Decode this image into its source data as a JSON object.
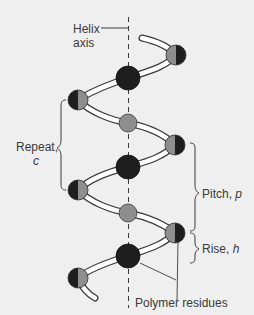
{
  "diagram": {
    "labels": {
      "helix_axis_line1": "Helix",
      "helix_axis_line2": "axis",
      "repeat_line1": "Repeat,",
      "repeat_symbol": "c",
      "pitch_text": "Pitch, ",
      "pitch_symbol": "p",
      "rise_text": "Rise, ",
      "rise_symbol": "h",
      "residues": "Polymer residues"
    },
    "colors": {
      "background": "#efefef",
      "residue_dark": "#1e1e1e",
      "residue_grey": "#8e8e8e",
      "backbone_fill": "#ffffff",
      "outline": "#3a3a3a",
      "text": "#3a3a3a"
    },
    "residues": [
      {
        "id": 1,
        "type": "half-grey-left",
        "position": "right"
      },
      {
        "id": 2,
        "type": "dark",
        "position": "center"
      },
      {
        "id": 3,
        "type": "half-dark-left",
        "position": "left"
      },
      {
        "id": 4,
        "type": "grey",
        "position": "center"
      },
      {
        "id": 5,
        "type": "half-grey-left",
        "position": "right"
      },
      {
        "id": 6,
        "type": "dark",
        "position": "center"
      },
      {
        "id": 7,
        "type": "half-dark-left",
        "position": "left"
      },
      {
        "id": 8,
        "type": "grey",
        "position": "center"
      },
      {
        "id": 9,
        "type": "half-grey-left",
        "position": "right"
      },
      {
        "id": 10,
        "type": "dark",
        "position": "center"
      },
      {
        "id": 11,
        "type": "half-dark-left",
        "position": "left"
      }
    ]
  }
}
